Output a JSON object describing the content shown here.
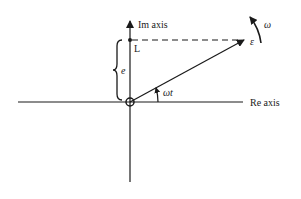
{
  "diagram": {
    "type": "phasor-diagram",
    "axes": {
      "imaginary_label": "Im axis",
      "real_label": "Re axis"
    },
    "labels": {
      "point_L": "L",
      "height": "e",
      "phasor": "ε",
      "angular_velocity": "ω",
      "angle": "ωt"
    },
    "colors": {
      "stroke": "#1a1a1a",
      "background": "#ffffff"
    }
  }
}
